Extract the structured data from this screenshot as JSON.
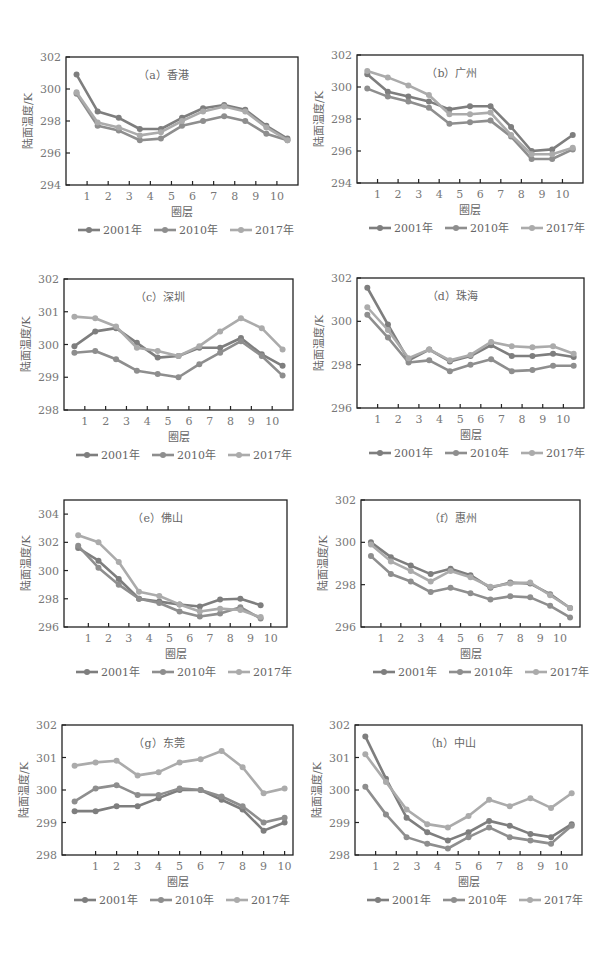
{
  "figure": {
    "xlabel": "圈层",
    "ylabel": "陆面温度/K",
    "legend": [
      {
        "label": "2001年",
        "color": "#7e7e7e"
      },
      {
        "label": "2010年",
        "color": "#8e8e8e"
      },
      {
        "label": "2017年",
        "color": "#ababab"
      }
    ]
  },
  "chart_data": [
    {
      "type": "line",
      "id": "a",
      "title": "（a）香港",
      "xlabel": "圈层",
      "ylabel": "陆面温度/K",
      "x_ticks": [
        1,
        2,
        3,
        4,
        5,
        6,
        7,
        8,
        9,
        10
      ],
      "x": [
        0.5,
        1.5,
        2.5,
        3.5,
        4.5,
        5.5,
        6.5,
        7.5,
        8.5,
        9.5,
        10.5
      ],
      "ylim": [
        294,
        302
      ],
      "y_ticks": [
        294,
        296,
        298,
        300,
        302
      ],
      "frame": [
        66,
        57,
        298,
        185
      ],
      "series": [
        {
          "name": "2001年",
          "values": [
            300.9,
            298.6,
            298.2,
            297.5,
            297.5,
            298.2,
            298.8,
            299.0,
            298.7,
            297.7,
            296.9
          ]
        },
        {
          "name": "2010年",
          "values": [
            299.7,
            297.7,
            297.4,
            296.8,
            296.9,
            297.7,
            298.0,
            298.3,
            298.0,
            297.2,
            296.8
          ]
        },
        {
          "name": "2017年",
          "values": [
            299.8,
            297.9,
            297.6,
            297.1,
            297.3,
            298.0,
            298.6,
            298.9,
            298.6,
            297.6,
            296.8
          ]
        }
      ]
    },
    {
      "type": "line",
      "id": "b",
      "title": "（b）广州",
      "xlabel": "圈层",
      "ylabel": "陆面温度/K",
      "x_ticks": [
        1,
        2,
        3,
        4,
        5,
        6,
        7,
        8,
        9,
        10
      ],
      "x": [
        0.5,
        1.5,
        2.5,
        3.5,
        4.5,
        5.5,
        6.5,
        7.5,
        8.5,
        9.5,
        10.5
      ],
      "ylim": [
        294,
        302
      ],
      "y_ticks": [
        294,
        296,
        298,
        300,
        302
      ],
      "frame": [
        357,
        55,
        583,
        183
      ],
      "series": [
        {
          "name": "2001年",
          "values": [
            300.8,
            299.7,
            299.4,
            299.1,
            298.6,
            298.8,
            298.8,
            297.5,
            296.0,
            296.1,
            297.0
          ]
        },
        {
          "name": "2010年",
          "values": [
            299.9,
            299.4,
            299.1,
            298.7,
            297.7,
            297.8,
            297.9,
            296.9,
            295.5,
            295.5,
            296.1
          ]
        },
        {
          "name": "2017年",
          "values": [
            301.0,
            300.6,
            300.1,
            299.5,
            298.3,
            298.3,
            298.4,
            297.0,
            295.8,
            295.8,
            296.2
          ]
        }
      ]
    },
    {
      "type": "line",
      "id": "c",
      "title": "（c）深圳",
      "xlabel": "圈层",
      "ylabel": "陆面温度/K",
      "x_ticks": [
        1,
        2,
        3,
        4,
        5,
        6,
        7,
        8,
        9,
        10
      ],
      "x": [
        0.5,
        1.5,
        2.5,
        3.5,
        4.5,
        5.5,
        6.5,
        7.5,
        8.5,
        9.5,
        10.5
      ],
      "ylim": [
        298,
        302
      ],
      "y_ticks": [
        298,
        299,
        300,
        301,
        302
      ],
      "frame": [
        64,
        279,
        293,
        410
      ],
      "series": [
        {
          "name": "2001年",
          "values": [
            299.95,
            300.4,
            300.5,
            300.05,
            299.6,
            299.65,
            299.9,
            299.9,
            300.2,
            299.7,
            299.35
          ]
        },
        {
          "name": "2010年",
          "values": [
            299.75,
            299.8,
            299.55,
            299.2,
            299.1,
            299.0,
            299.4,
            299.75,
            300.1,
            299.65,
            299.05
          ]
        },
        {
          "name": "2017年",
          "values": [
            300.85,
            300.8,
            300.55,
            299.9,
            299.8,
            299.65,
            299.95,
            300.4,
            300.8,
            300.5,
            299.85
          ]
        }
      ]
    },
    {
      "type": "line",
      "id": "d",
      "title": "（d）珠海",
      "xlabel": "圈层",
      "ylabel": "陆面温度/K",
      "x_ticks": [
        1,
        2,
        3,
        4,
        5,
        6,
        7,
        8,
        9,
        10
      ],
      "x": [
        0.5,
        1.5,
        2.5,
        3.5,
        4.5,
        5.5,
        6.5,
        7.5,
        8.5,
        9.5,
        10.5
      ],
      "ylim": [
        296,
        302
      ],
      "y_ticks": [
        296,
        298,
        300,
        302
      ],
      "frame": [
        357,
        278,
        584,
        408
      ],
      "series": [
        {
          "name": "2001年",
          "values": [
            301.55,
            299.85,
            298.2,
            298.7,
            298.15,
            298.4,
            298.9,
            298.4,
            298.4,
            298.5,
            298.35
          ]
        },
        {
          "name": "2010年",
          "values": [
            300.3,
            299.25,
            298.1,
            298.2,
            297.7,
            298.0,
            298.25,
            297.7,
            297.75,
            297.95,
            297.95
          ]
        },
        {
          "name": "2017年",
          "values": [
            300.65,
            299.6,
            298.3,
            298.7,
            298.2,
            298.45,
            299.05,
            298.85,
            298.8,
            298.85,
            298.5
          ]
        }
      ]
    },
    {
      "type": "line",
      "id": "e",
      "title": "（e）佛山",
      "xlabel": "圈层",
      "ylabel": "陆面温度/K",
      "x_ticks": [
        1,
        2,
        3,
        4,
        5,
        6,
        7,
        8,
        9,
        10
      ],
      "x": [
        0.7,
        1.7,
        2.7,
        3.7,
        4.7,
        5.7,
        6.7,
        7.7,
        8.7,
        9.7
      ],
      "ylim": [
        296,
        305
      ],
      "y_ticks": [
        296,
        298,
        300,
        302,
        304
      ],
      "frame": [
        64,
        500,
        287,
        627
      ],
      "series": [
        {
          "name": "2001年",
          "values": [
            301.6,
            300.7,
            299.4,
            298.0,
            297.8,
            297.6,
            297.45,
            297.95,
            298.0,
            297.55
          ]
        },
        {
          "name": "2010年",
          "values": [
            301.75,
            300.2,
            299.0,
            298.0,
            297.7,
            297.1,
            296.75,
            296.95,
            297.4,
            296.6
          ]
        },
        {
          "name": "2017年",
          "values": [
            302.5,
            302.0,
            300.6,
            298.5,
            298.2,
            297.6,
            297.1,
            297.3,
            297.2,
            296.7
          ]
        }
      ]
    },
    {
      "type": "line",
      "id": "f",
      "title": "（f）惠州",
      "xlabel": "圈层",
      "ylabel": "陆面温度/K",
      "x_ticks": [
        1,
        2,
        3,
        4,
        5,
        6,
        7,
        8,
        9,
        10
      ],
      "x": [
        0.5,
        1.5,
        2.5,
        3.5,
        4.5,
        5.5,
        6.5,
        7.5,
        8.5,
        9.5,
        10.5
      ],
      "ylim": [
        296,
        302
      ],
      "y_ticks": [
        296,
        298,
        300,
        302
      ],
      "frame": [
        361,
        500,
        580,
        627
      ],
      "series": [
        {
          "name": "2001年",
          "values": [
            300.0,
            299.3,
            298.9,
            298.5,
            298.75,
            298.45,
            297.85,
            298.1,
            298.05,
            297.55,
            296.9
          ]
        },
        {
          "name": "2010年",
          "values": [
            299.35,
            298.5,
            298.15,
            297.65,
            297.85,
            297.6,
            297.3,
            297.45,
            297.4,
            297.0,
            296.45
          ]
        },
        {
          "name": "2017年",
          "values": [
            299.9,
            299.1,
            298.65,
            298.15,
            298.65,
            298.35,
            297.9,
            298.05,
            298.1,
            297.5,
            296.9
          ]
        }
      ]
    },
    {
      "type": "line",
      "id": "g",
      "title": "（g）东莞",
      "xlabel": "圈层",
      "ylabel": "陆面温度/K",
      "x_ticks": [
        1,
        2,
        3,
        4,
        5,
        6,
        7,
        8,
        9,
        10
      ],
      "x": [
        0,
        1,
        2,
        3,
        4,
        5,
        6,
        7,
        8,
        9,
        10
      ],
      "x_offset": 0.6,
      "ylim": [
        298,
        302
      ],
      "y_ticks": [
        298,
        299,
        300,
        301,
        302
      ],
      "frame": [
        62,
        725,
        293,
        855
      ],
      "series": [
        {
          "name": "2001年",
          "values": [
            299.35,
            299.35,
            299.5,
            299.5,
            299.75,
            300.0,
            300.0,
            299.7,
            299.4,
            298.75,
            299.0
          ]
        },
        {
          "name": "2010年",
          "values": [
            299.65,
            300.05,
            300.15,
            299.85,
            299.85,
            300.05,
            300.0,
            299.8,
            299.5,
            299.0,
            299.15
          ]
        },
        {
          "name": "2017年",
          "values": [
            300.75,
            300.85,
            300.9,
            300.45,
            300.55,
            300.85,
            300.95,
            301.2,
            300.7,
            299.9,
            300.05
          ]
        }
      ]
    },
    {
      "type": "line",
      "id": "h",
      "title": "（h）中山",
      "xlabel": "圈层",
      "ylabel": "陆面温度/K",
      "x_ticks": [
        1,
        2,
        3,
        4,
        5,
        6,
        7,
        8,
        9,
        10
      ],
      "x": [
        0.5,
        1.5,
        2.5,
        3.5,
        4.5,
        5.5,
        6.5,
        7.5,
        8.5,
        9.5,
        10.5
      ],
      "ylim": [
        298,
        302
      ],
      "y_ticks": [
        298,
        299,
        300,
        301,
        302
      ],
      "frame": [
        355,
        725,
        582,
        855
      ],
      "series": [
        {
          "name": "2001年",
          "values": [
            301.65,
            300.35,
            299.15,
            298.7,
            298.45,
            298.7,
            299.05,
            298.9,
            298.65,
            298.55,
            298.95
          ]
        },
        {
          "name": "2010年",
          "values": [
            300.1,
            299.25,
            298.55,
            298.35,
            298.2,
            298.55,
            298.85,
            298.55,
            298.45,
            298.35,
            298.9
          ]
        },
        {
          "name": "2017年",
          "values": [
            301.1,
            300.25,
            299.4,
            298.95,
            298.85,
            299.2,
            299.7,
            299.5,
            299.75,
            299.45,
            299.9
          ]
        }
      ]
    }
  ]
}
